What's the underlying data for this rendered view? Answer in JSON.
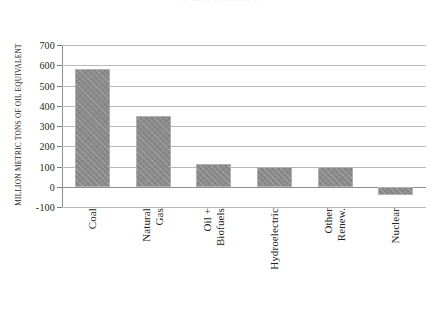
{
  "figure": {
    "title_fragment": "… …… ………… …",
    "background": "#ffffff",
    "bar_color": "#8a8a8a",
    "bar_border_color": "#b0b0b0",
    "gridline_color": "#b9b9b9",
    "axis_color": "#8d8d8d",
    "text_color": "#231f20"
  },
  "chart_data": {
    "type": "bar",
    "title": "",
    "xlabel": "",
    "ylabel": "MILLION METRIC TONS OF OIL EQUIVALENT",
    "ylim": [
      -100,
      700
    ],
    "ytick_step": 100,
    "yticks": [
      700,
      600,
      500,
      400,
      300,
      200,
      100,
      0,
      -100
    ],
    "ytick_labels": [
      "700",
      "600",
      "500",
      "400",
      "300",
      "200",
      "100",
      "0",
      "-100"
    ],
    "grid": "horizontal",
    "legend": "none",
    "orientation": "vertical",
    "categories": [
      "Coal",
      "Natural Gas",
      "Oil + Biofuels",
      "Hydroelectric",
      "Other Renew.",
      "Nuclear"
    ],
    "category_label_lines": [
      [
        "Coal"
      ],
      [
        "Natural",
        "Gas"
      ],
      [
        "Oil +",
        "Biofuels"
      ],
      [
        "Hydroelectric"
      ],
      [
        "Other",
        "Renew."
      ],
      [
        "Nuclear"
      ]
    ],
    "values": [
      580,
      350,
      112,
      100,
      96,
      -40
    ],
    "series": [
      {
        "name": "Energy consumption",
        "values": [
          580,
          350,
          112,
          100,
          96,
          -40
        ]
      }
    ]
  }
}
